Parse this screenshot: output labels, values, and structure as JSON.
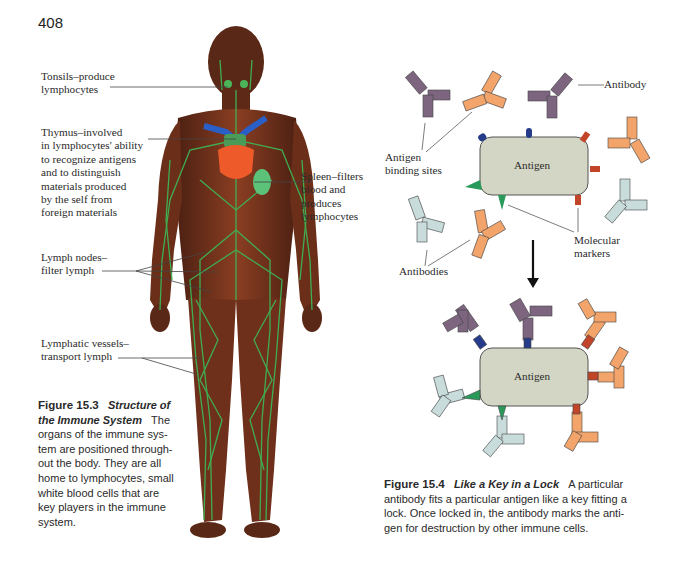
{
  "page": {
    "number": "408"
  },
  "figure_15_3": {
    "labels": {
      "tonsils": [
        "Tonsils–produce",
        "lymphocytes"
      ],
      "thymus": [
        "Thymus–involved",
        "in lymphocytes' ability",
        "to recognize antigens",
        "and to distinguish",
        "materials produced",
        "by the self from",
        "foreign materials"
      ],
      "spleen": [
        "Spleen–filters",
        "blood and",
        "produces",
        "lymphocytes"
      ],
      "lymph_nodes": [
        "Lymph nodes–",
        "filter lymph"
      ],
      "lymphatic_vessels": [
        "Lymphatic vessels–",
        "transport lymph"
      ]
    },
    "caption": {
      "number": "Figure 15.3",
      "title_lines": [
        "Structure of",
        "the Immune System"
      ],
      "lines": [
        "The",
        "organs of the immune sys-",
        "tem are positioned through-",
        "out the body. They are all",
        "home to lymphocytes, small",
        "white blood cells that are",
        "key players in the immune",
        "system."
      ]
    }
  },
  "figure_15_4": {
    "labels": {
      "antibody": "Antibody",
      "antigen_binding_sites": [
        "Antigen",
        "binding sites"
      ],
      "antigen_top": "Antigen",
      "antigen_bottom": "Antigen",
      "molecular_markers": [
        "Molecular",
        "markers"
      ],
      "antibodies": "Antibodies"
    },
    "caption": {
      "number": "Figure 15.4",
      "title": "Like a Key in a Lock",
      "lines": [
        "A particular",
        "antibody fits a particular antigen like a key fitting a",
        "lock. Once locked in, the antibody marks the anti-",
        "gen for destruction by other immune cells."
      ]
    },
    "colors": {
      "antigen_fill": "#d3d6c4",
      "purple_antibody": "#7d6580",
      "orange_antibody": "#f2a46a",
      "lightblue_antibody": "#c8dcdc",
      "blue_marker": "#263c8a",
      "red_marker": "#c2452a",
      "green_marker": "#2a9a5a"
    }
  }
}
